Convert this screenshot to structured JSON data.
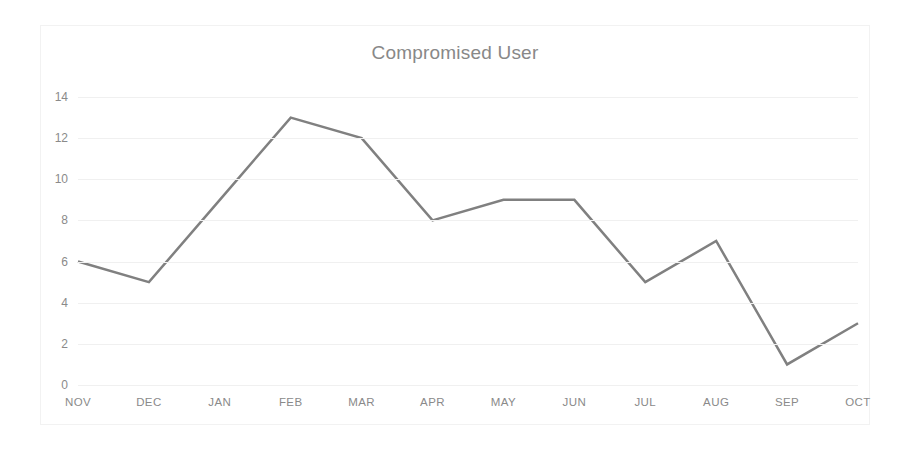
{
  "chart_data": {
    "type": "line",
    "title": "Compromised User",
    "xlabel": "",
    "ylabel": "",
    "categories": [
      "NOV",
      "DEC",
      "JAN",
      "FEB",
      "MAR",
      "APR",
      "MAY",
      "JUN",
      "JUL",
      "AUG",
      "SEP",
      "OCT"
    ],
    "values": [
      6,
      5,
      9,
      13,
      12,
      8,
      9,
      9,
      5,
      7,
      1,
      3
    ],
    "series": [
      {
        "name": "Compromised User",
        "values": [
          6,
          5,
          9,
          13,
          12,
          8,
          9,
          9,
          5,
          7,
          1,
          3
        ]
      }
    ],
    "ylim": [
      0,
      14
    ],
    "ytick_step": 2,
    "yticks": [
      14,
      12,
      10,
      8,
      6,
      4,
      2,
      0
    ],
    "grid": true,
    "grid_axis": "y",
    "legend": false,
    "legend_position": "none",
    "markers": false,
    "line_color": "#808080",
    "line_width": 2.5,
    "grid_color": "#f0f0f0",
    "tick_label_color": "#8a8a8a",
    "title_color": "#888888",
    "plot_background": "#ffffff",
    "frame_border_color": "#f2f2f2"
  }
}
